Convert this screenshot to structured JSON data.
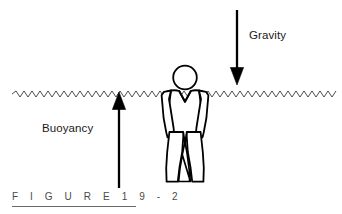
{
  "figure": {
    "caption": "F I G U R E   1 9 - 2",
    "caption_plain": "FIGURE 19-2",
    "width": 342,
    "height": 214,
    "background_color": "#ffffff"
  },
  "labels": {
    "gravity": "Gravity",
    "buoyancy": "Buoyancy"
  },
  "colors": {
    "ink": "#000000",
    "caption_ink": "#4a4a4a",
    "waterline": "#333333",
    "rule": "#6a6a6a"
  },
  "diagram": {
    "waterline": {
      "name": "water-surface",
      "y": 94,
      "x_start": 12,
      "x_end": 338,
      "style": "zigzag-wave",
      "amplitude": 3,
      "wavelength": 8
    },
    "person": {
      "name": "person-figure",
      "center_x": 185,
      "head_center_y": 77,
      "head_radius": 12,
      "feet_y": 182,
      "style": "outline"
    },
    "arrows": [
      {
        "name": "gravity-arrow",
        "label": "Gravity",
        "direction": "down",
        "x": 237,
        "tail_y": 10,
        "tip_y": 85,
        "head_width": 13,
        "head_length": 17,
        "shaft_width": 2.2
      },
      {
        "name": "buoyancy-arrow",
        "label": "Buoyancy",
        "direction": "up",
        "x": 119,
        "tail_y": 188,
        "tip_y": 92,
        "head_width": 13,
        "head_length": 17,
        "shaft_width": 2.2
      }
    ]
  }
}
